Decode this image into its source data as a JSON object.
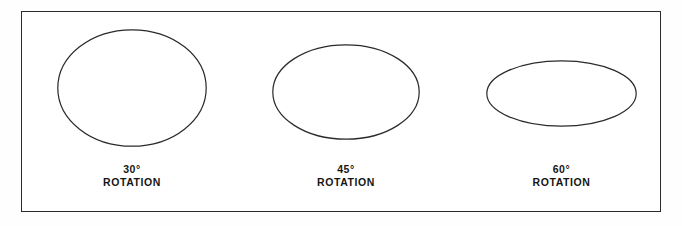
{
  "figure": {
    "background_color": "#fefefe",
    "frame": {
      "border_color": "#2b2b2b",
      "fill_color": "#ffffff"
    },
    "stroke_color": "#2a2a2a",
    "text_color": "#151515",
    "items": [
      {
        "name": "ellipse-30",
        "angle_label": "30°",
        "rotation_label": "ROTATION",
        "center_x": 132,
        "center_y": 88,
        "radius_x": 75,
        "radius_y": 59
      },
      {
        "name": "ellipse-45",
        "angle_label": "45°",
        "rotation_label": "ROTATION",
        "center_x": 346,
        "center_y": 92,
        "radius_x": 74,
        "radius_y": 48
      },
      {
        "name": "ellipse-60",
        "angle_label": "60°",
        "rotation_label": "ROTATION",
        "center_x": 561,
        "center_y": 93,
        "radius_x": 75,
        "radius_y": 34
      }
    ],
    "caption_baseline_y": 163
  }
}
